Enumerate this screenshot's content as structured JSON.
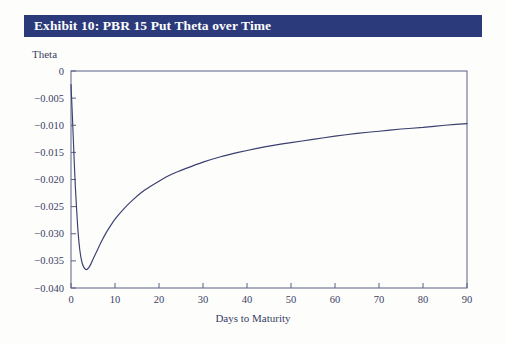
{
  "exhibit": {
    "title": "Exhibit 10: PBR 15 Put Theta over Time",
    "title_bar_color": "#2b3a7a",
    "title_text_color": "#ffffff"
  },
  "axes": {
    "y_axis_label": "Theta",
    "x_axis_label": "Days to Maturity",
    "y_tick_labels": [
      "0",
      "−0.005",
      "−0.010",
      "−0.015",
      "−0.020",
      "−0.025",
      "−0.030",
      "−0.035",
      "−0.040"
    ],
    "x_tick_labels": [
      "0",
      "10",
      "20",
      "30",
      "40",
      "50",
      "60",
      "70",
      "80",
      "90"
    ],
    "axis_color": "#5a5f86",
    "tick_text_color": "#3b3f63"
  },
  "chart_data": {
    "type": "line",
    "title": "Exhibit 10: PBR 15 Put Theta over Time",
    "xlabel": "Days to Maturity",
    "ylabel": "Theta",
    "xlim": [
      0,
      90
    ],
    "ylim": [
      -0.04,
      0
    ],
    "xticks": [
      0,
      10,
      20,
      30,
      40,
      50,
      60,
      70,
      80,
      90
    ],
    "yticks": [
      0,
      -0.005,
      -0.01,
      -0.015,
      -0.02,
      -0.025,
      -0.03,
      -0.035,
      -0.04
    ],
    "grid": false,
    "legend": false,
    "line_color": "#3a3f6e",
    "series": [
      {
        "name": "PBR 15 Put Theta",
        "x": [
          0,
          0.3,
          0.7,
          1,
          1.5,
          2,
          2.5,
          3,
          3.5,
          4,
          4.5,
          5,
          6,
          7,
          8,
          9,
          10,
          12,
          14,
          16,
          18,
          20,
          23,
          26,
          30,
          34,
          38,
          42,
          46,
          50,
          55,
          60,
          65,
          70,
          75,
          80,
          85,
          90
        ],
        "y": [
          -0.0025,
          -0.008,
          -0.016,
          -0.0215,
          -0.0285,
          -0.033,
          -0.0353,
          -0.0363,
          -0.0366,
          -0.0363,
          -0.0356,
          -0.0347,
          -0.033,
          -0.0313,
          -0.0298,
          -0.0285,
          -0.0273,
          -0.0254,
          -0.0238,
          -0.0224,
          -0.0213,
          -0.0203,
          -0.019,
          -0.018,
          -0.0168,
          -0.0158,
          -0.015,
          -0.0143,
          -0.0137,
          -0.0132,
          -0.0126,
          -0.012,
          -0.0115,
          -0.0111,
          -0.0107,
          -0.0104,
          -0.01,
          -0.0097
        ]
      }
    ],
    "annotations": {
      "minimum_value": -0.0366,
      "minimum_at_day": 3.5,
      "start_value": -0.0025,
      "end_value": -0.0097
    }
  }
}
